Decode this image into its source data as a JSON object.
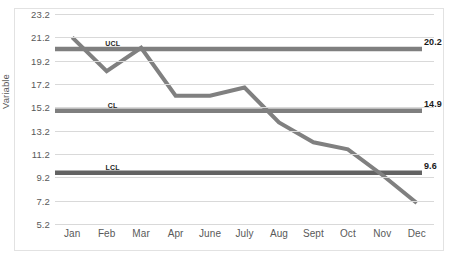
{
  "chart_data": {
    "type": "line",
    "title": "",
    "xlabel": "",
    "ylabel": "Variable",
    "ylim": [
      5.2,
      23.2
    ],
    "ytick_labels": [
      "23.2",
      "21.2",
      "19.2",
      "17.2",
      "15.2",
      "13.2",
      "11.2",
      "9.2",
      "7.2",
      "5.2"
    ],
    "yticks": [
      23.2,
      21.2,
      19.2,
      17.2,
      15.2,
      13.2,
      11.2,
      9.2,
      7.2,
      5.2
    ],
    "grid": true,
    "legend": "none",
    "categories": [
      "Jan",
      "Feb",
      "Mar",
      "Apr",
      "June",
      "July",
      "Aug",
      "Sept",
      "Oct",
      "Nov",
      "Dec"
    ],
    "series": [
      {
        "name": "Variable",
        "values": [
          21.2,
          18.3,
          20.3,
          16.2,
          16.2,
          16.9,
          13.9,
          12.2,
          11.6,
          9.4,
          7.0
        ],
        "color": "#808080"
      }
    ],
    "control_limits": [
      {
        "id": "ucl",
        "label": "UCL",
        "value": 20.2,
        "value_label": "20.2",
        "color": "#7f7f7f"
      },
      {
        "id": "cl",
        "label": "CL",
        "value": 14.9,
        "value_label": "14.9",
        "color": "#7f7f7f"
      },
      {
        "id": "lcl",
        "label": "LCL",
        "value": 9.6,
        "value_label": "9.6",
        "color": "#636363"
      }
    ]
  },
  "colors": {
    "gridline": "#d9d9d9",
    "frame": "#e2e2e2",
    "axis_text": "#595959",
    "label_text": "#1a1a1a",
    "background": "#ffffff"
  }
}
